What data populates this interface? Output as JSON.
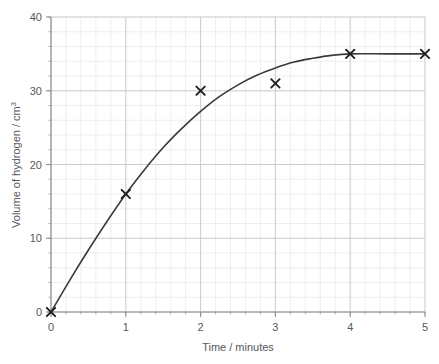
{
  "chart_data": {
    "type": "scatter",
    "title": "",
    "xlabel": "Time / minutes",
    "ylabel": "Volume of hydrogen / cm",
    "ylabel_superscript": "3",
    "xlim": [
      0,
      5
    ],
    "ylim": [
      0,
      40
    ],
    "x_ticks": [
      0,
      1,
      2,
      3,
      4,
      5
    ],
    "y_ticks": [
      0,
      10,
      20,
      30,
      40
    ],
    "x_tick_labels": [
      "0",
      "1",
      "2",
      "3",
      "4",
      "5"
    ],
    "y_tick_labels": [
      "0",
      "10",
      "20",
      "30",
      "40"
    ],
    "x_minor_step": 0.2,
    "y_minor_step": 2,
    "grid": true,
    "grid_minor": true,
    "legend": "none",
    "marker": "x",
    "series": [
      {
        "name": "Volume of hydrogen",
        "marker": "x",
        "points": [
          {
            "x": 0,
            "y": 0
          },
          {
            "x": 1,
            "y": 16
          },
          {
            "x": 2,
            "y": 30
          },
          {
            "x": 3,
            "y": 31
          },
          {
            "x": 4,
            "y": 35
          },
          {
            "x": 5,
            "y": 35
          }
        ]
      }
    ],
    "fit_curve": {
      "name": "best-fit curve",
      "description": "smooth rising curve plateauing at 35",
      "points": [
        {
          "x": 0,
          "y": 0
        },
        {
          "x": 0.25,
          "y": 4.3
        },
        {
          "x": 0.5,
          "y": 8.4
        },
        {
          "x": 0.75,
          "y": 12.3
        },
        {
          "x": 1,
          "y": 16
        },
        {
          "x": 1.25,
          "y": 19.3
        },
        {
          "x": 1.5,
          "y": 22.3
        },
        {
          "x": 1.75,
          "y": 24.9
        },
        {
          "x": 2,
          "y": 27.2
        },
        {
          "x": 2.25,
          "y": 29.2
        },
        {
          "x": 2.5,
          "y": 30.8
        },
        {
          "x": 2.75,
          "y": 32.1
        },
        {
          "x": 3,
          "y": 33.1
        },
        {
          "x": 3.25,
          "y": 33.9
        },
        {
          "x": 3.5,
          "y": 34.4
        },
        {
          "x": 3.75,
          "y": 34.8
        },
        {
          "x": 4,
          "y": 35
        },
        {
          "x": 4.5,
          "y": 35
        },
        {
          "x": 5,
          "y": 35
        }
      ]
    },
    "colors": {
      "curve": "#3a3a3c",
      "marker": "#1f1f21",
      "axis": "#8d8e90",
      "grid_major": "#c9c9cc",
      "grid_minor": "#e6e6e9",
      "text": "#57585a",
      "background": "#ffffff"
    }
  }
}
